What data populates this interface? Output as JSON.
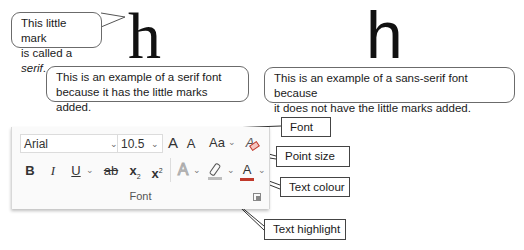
{
  "serif_example": {
    "glyph": "h",
    "callout_line1": "This little mark",
    "callout_line2_prefix": "is called a ",
    "callout_line2_em": "serif",
    "callout_line2_suffix": ".",
    "caption_line1": "This is an example of a serif font",
    "caption_line2": "because it has the little marks added."
  },
  "sans_example": {
    "glyph": "h",
    "caption_line1": "This is an example of a sans-serif font because",
    "caption_line2": "it does not have the little marks added."
  },
  "ribbon": {
    "font_name": "Arial",
    "font_size": "10.5",
    "grow_font": "A",
    "shrink_font": "A",
    "change_case": "Aa",
    "clear_formatting": "A",
    "bold": "B",
    "italic": "I",
    "underline": "U",
    "strikethrough": "ab",
    "subscript": "x",
    "subscript_mark": "2",
    "superscript": "x",
    "superscript_mark": "2",
    "text_effects": "A",
    "font_color": "A",
    "group_label": "Font",
    "font_color_hex": "#c0392b",
    "highlight_color_hex": "#bdbdbd"
  },
  "callouts": {
    "font": "Font",
    "point_size": "Point size",
    "text_colour": "Text colour",
    "text_highlight": "Text highlight"
  },
  "icons": {
    "dropdown": "chevron-down-icon",
    "highlighter": "highlighter-pen-icon",
    "clear_formatting": "eraser-icon",
    "dialog_launcher": "dialog-launcher-icon"
  }
}
